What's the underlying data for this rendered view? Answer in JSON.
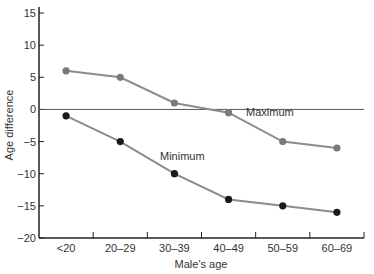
{
  "chart_data": {
    "type": "line",
    "title": "",
    "xlabel": "Male's age",
    "ylabel": "Age difference",
    "categories": [
      "<20",
      "20–29",
      "30–39",
      "40–49",
      "50–59",
      "60–69"
    ],
    "series": [
      {
        "name": "Maximum",
        "values": [
          6,
          5,
          1,
          -0.5,
          -5,
          -6
        ],
        "color": "#8c8c8c",
        "marker_color": "#7a7a7a"
      },
      {
        "name": "Minimum",
        "values": [
          -1,
          -5,
          -10,
          -14,
          -15,
          -16
        ],
        "color": "#8c8c8c",
        "marker_color": "#1a1a1a"
      }
    ],
    "ylim": [
      -20,
      15
    ],
    "yticks": [
      15,
      10,
      5,
      0,
      -5,
      -10,
      -15,
      -20
    ],
    "ytick_labels": [
      "15",
      "10",
      "5",
      "0",
      "−5",
      "−10",
      "−15",
      "−20"
    ],
    "reference_line": 0,
    "grid": false,
    "legend": "inline labels",
    "annotations": [
      {
        "text": "Maximum",
        "near": "40–49"
      },
      {
        "text": "Minimum",
        "near": "30–39"
      }
    ]
  }
}
